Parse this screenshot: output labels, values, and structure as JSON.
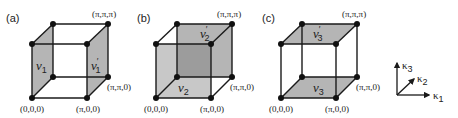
{
  "figure": {
    "panels": [
      {
        "id": "a",
        "label": "(a)",
        "shaded_faces": "left and right side faces",
        "face_labels": [
          {
            "symbol": "ν",
            "sub": "1",
            "prime": ""
          },
          {
            "symbol": "ν",
            "sub": "1",
            "prime": "′"
          }
        ],
        "vertex_labels": {
          "top": "(π,π,π)",
          "right": "(π,π,0)",
          "bottom_left": "(0,0,0)",
          "bottom_right": "(π,0,0)"
        }
      },
      {
        "id": "b",
        "label": "(b)",
        "shaded_faces": "front and back faces",
        "face_labels": [
          {
            "symbol": "ν",
            "sub": "2",
            "prime": ""
          },
          {
            "symbol": "ν",
            "sub": "2",
            "prime": "′"
          }
        ],
        "vertex_labels": {
          "top": "(π,π,π)",
          "right": "(π,π,0)",
          "bottom_left": "(0,0,0)",
          "bottom_right": "(π,0,0)"
        }
      },
      {
        "id": "c",
        "label": "(c)",
        "shaded_faces": "top and bottom faces",
        "face_labels": [
          {
            "symbol": "ν",
            "sub": "3",
            "prime": ""
          },
          {
            "symbol": "ν",
            "sub": "3",
            "prime": "′"
          }
        ],
        "vertex_labels": {
          "top": "(π,π,π)",
          "right": "(π,π,0)",
          "bottom_left": "(0,0,0)",
          "bottom_right": "(π,0,0)"
        }
      }
    ],
    "axes": {
      "k1": {
        "symbol": "κ",
        "sub": "1"
      },
      "k2": {
        "symbol": "κ",
        "sub": "2"
      },
      "k3": {
        "symbol": "κ",
        "sub": "3"
      }
    },
    "colors": {
      "face_fill": "#b5b5b5",
      "face_fill_dark": "#9c9c9c",
      "edge": "#1a1a1a",
      "vertex": "#111111",
      "background": "#ffffff"
    }
  }
}
